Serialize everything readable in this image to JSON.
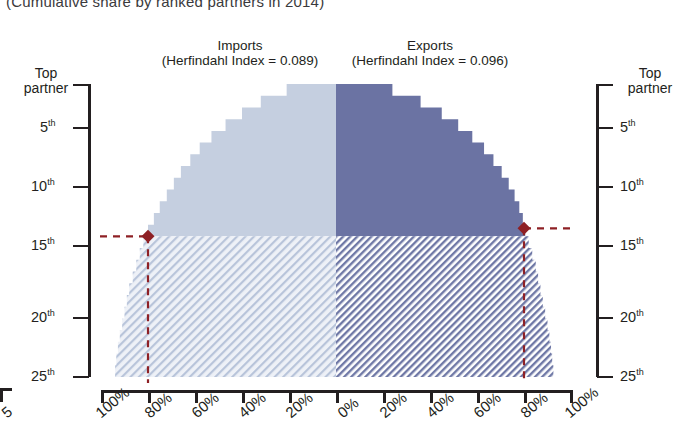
{
  "subtitle": "(Cumulative share by ranked partners in 2014)",
  "panels": {
    "imports": {
      "title": "Imports",
      "index_label": "(Herfindahl Index = 0.089)",
      "herfindahl_index": 0.089,
      "color_solid": "#c5cfe0",
      "color_hatch_bg": "#e8ecf4",
      "color_hatch_line": "#aab9d2"
    },
    "exports": {
      "title": "Exports",
      "index_label": "(Herfindahl Index = 0.096)",
      "herfindahl_index": 0.096,
      "color_solid": "#6b73a3",
      "color_hatch_bg": "#ffffff",
      "color_hatch_line": "#6b73a3"
    }
  },
  "axes": {
    "y_left": {
      "cap_line1": "Top",
      "cap_line2": "partner",
      "ticks": [
        {
          "rank": 1,
          "label": "Top partner"
        },
        {
          "rank": 5,
          "label": "5",
          "suffix": "th"
        },
        {
          "rank": 10,
          "label": "10",
          "suffix": "th"
        },
        {
          "rank": 15,
          "label": "15",
          "suffix": "th"
        },
        {
          "rank": 20,
          "label": "20",
          "suffix": "th"
        },
        {
          "rank": 25,
          "label": "25",
          "suffix": "th"
        }
      ]
    },
    "y_right": {
      "cap_line1": "Top",
      "cap_line2": "partner",
      "ticks": [
        {
          "rank": 1,
          "label": "Top partner"
        },
        {
          "rank": 5,
          "label": "5",
          "suffix": "th"
        },
        {
          "rank": 10,
          "label": "10",
          "suffix": "th"
        },
        {
          "rank": 15,
          "label": "15",
          "suffix": "th"
        },
        {
          "rank": 20,
          "label": "20",
          "suffix": "th"
        },
        {
          "rank": 25,
          "label": "25",
          "suffix": "th"
        }
      ]
    },
    "x_left_labels": [
      "100%",
      "80%",
      "60%",
      "40%",
      "20%",
      "0%"
    ],
    "x_right_labels": [
      "20%",
      "40%",
      "60%",
      "80%",
      "100%"
    ],
    "x_left_values": [
      100,
      80,
      60,
      40,
      20,
      0
    ],
    "x_right_values": [
      20,
      40,
      60,
      80,
      100
    ],
    "left_edge_crop": "5"
  },
  "markers": {
    "color": "#8e2025",
    "imports": {
      "rank": 13,
      "share": 80,
      "share_label": "80%"
    },
    "exports": {
      "rank": 13,
      "share": 80,
      "share_label": "80%"
    }
  },
  "chart_data": {
    "type": "area",
    "title": "",
    "subtitle": "(Cumulative share by ranked partners in 2014)",
    "xlabel": "",
    "ylabel": "Partner rank",
    "grid": false,
    "legend": "none",
    "orientation": "back-to-back mirrored cumulative-share pyramid",
    "ylim": [
      1,
      25
    ],
    "xlim": [
      0,
      100
    ],
    "ytick_labels": [
      "Top partner",
      "5th",
      "10th",
      "15th",
      "20th",
      "25th"
    ],
    "ytick_values": [
      1,
      5,
      10,
      15,
      20,
      25
    ],
    "xtick_labels_left": [
      "100%",
      "80%",
      "60%",
      "40%",
      "20%",
      "0%"
    ],
    "xtick_labels_right": [
      "0%",
      "20%",
      "40%",
      "60%",
      "80%",
      "100%"
    ],
    "annotations": [
      "Imports (Herfindahl Index = 0.089)",
      "Exports (Herfindahl Index = 0.096)"
    ],
    "ranks": [
      1,
      2,
      3,
      4,
      5,
      6,
      7,
      8,
      9,
      10,
      11,
      12,
      13,
      14,
      15,
      16,
      17,
      18,
      19,
      20,
      21,
      22,
      23,
      24,
      25
    ],
    "series": [
      {
        "name": "Imports",
        "direction": "left",
        "unit": "%",
        "values": [
          21,
          32,
          40,
          47,
          53,
          58,
          62,
          66,
          69,
          72,
          75,
          77.5,
          80,
          82,
          83.5,
          85,
          86.5,
          88,
          89,
          90,
          91,
          92,
          92.8,
          93.5,
          94
        ]
      },
      {
        "name": "Exports",
        "direction": "right",
        "unit": "%",
        "values": [
          24,
          36,
          45,
          52,
          58,
          63,
          67,
          70.5,
          73.5,
          76,
          78,
          79.5,
          80.5,
          82,
          83.5,
          85,
          86,
          87,
          88,
          89,
          90,
          90.8,
          91.5,
          92,
          92.5
        ]
      }
    ],
    "marker_points": [
      {
        "series": "Imports",
        "rank": 13,
        "value": 80
      },
      {
        "series": "Exports",
        "rank": 13,
        "value": 80
      }
    ]
  }
}
